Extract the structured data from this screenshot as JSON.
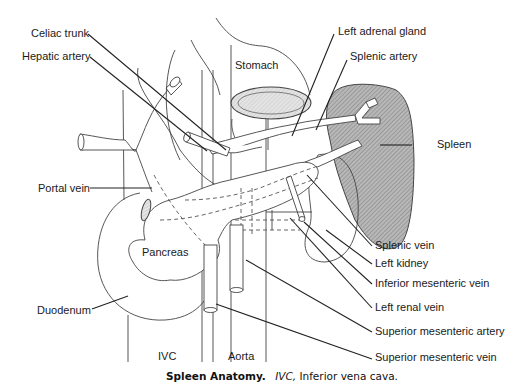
{
  "figure": {
    "title": "Spleen Anatomy.",
    "caption_abbrev": "IVC,",
    "caption_rest": "Inferior vena cava.",
    "colors": {
      "line": "#444444",
      "spleen_fill": "#9a9a9a",
      "background": "#ffffff"
    }
  },
  "labels": {
    "celiac_trunk": "Celiac trunk",
    "hepatic_artery": "Hepatic artery",
    "portal_vein": "Portal vein",
    "pancreas": "Pancreas",
    "duodenum": "Duodenum",
    "ivc": "IVC",
    "aorta": "Aorta",
    "stomach": "Stomach",
    "left_adrenal_gland": "Left adrenal gland",
    "splenic_artery": "Splenic artery",
    "spleen": "Spleen",
    "splenic_vein": "Splenic vein",
    "left_kidney": "Left kidney",
    "inferior_mesenteric_vein": "Inferior mesenteric vein",
    "left_renal_vein": "Left renal vein",
    "superior_mesenteric_artery": "Superior mesenteric artery",
    "superior_mesenteric_vein": "Superior mesenteric vein"
  }
}
